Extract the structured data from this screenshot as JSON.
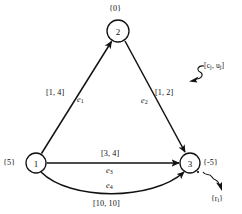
{
  "figure": {
    "type": "network-flow-diagram",
    "background_color": "#ffffff",
    "line_color": "#111111"
  },
  "nodes": [
    {
      "id": "1",
      "number": "1",
      "supply_label": "{5}",
      "cx": 36,
      "cy": 163,
      "r": 10
    },
    {
      "id": "2",
      "number": "2",
      "supply_label": "{0}",
      "cx": 118,
      "cy": 31,
      "r": 11
    },
    {
      "id": "3",
      "number": "3",
      "supply_label": "{-5}",
      "cx": 190,
      "cy": 163,
      "r": 10
    }
  ],
  "edges": [
    {
      "id": "e1",
      "name": "e",
      "subscript": "1",
      "from": "1",
      "to": "2",
      "cost_capacity": "[1, 4]",
      "shape": "straight"
    },
    {
      "id": "e2",
      "name": "e",
      "subscript": "2",
      "from": "2",
      "to": "3",
      "cost_capacity": "[1, 2]",
      "shape": "straight"
    },
    {
      "id": "e3",
      "name": "e",
      "subscript": "3",
      "from": "1",
      "to": "3",
      "cost_capacity": "[3, 4]",
      "shape": "straight"
    },
    {
      "id": "e4",
      "name": "e",
      "subscript": "4",
      "from": "1",
      "to": "3",
      "cost_capacity": "[10, 10]",
      "shape": "curved"
    }
  ],
  "annotations": [
    {
      "id": "edge-annotation",
      "text_prefix": "[c",
      "sub1": "j",
      "mid": ", u",
      "sub2": "j",
      "text_suffix": "]"
    },
    {
      "id": "node-annotation",
      "text_prefix": "{r",
      "sub1": "i",
      "text_suffix": "}"
    }
  ]
}
